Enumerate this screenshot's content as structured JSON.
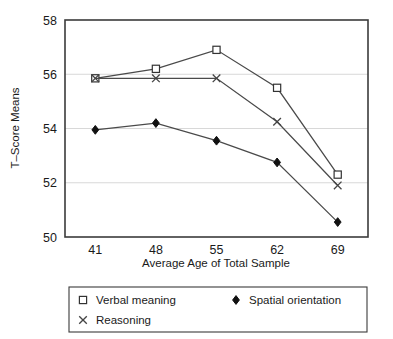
{
  "chart_data": {
    "type": "line",
    "title": "",
    "xlabel": "Average Age of Total Sample",
    "ylabel": "T–Score Means",
    "categories": [
      "41",
      "48",
      "55",
      "62",
      "69"
    ],
    "x": [
      41,
      48,
      55,
      62,
      69
    ],
    "xlim": [
      37.5,
      72.5
    ],
    "ylim": [
      50,
      58
    ],
    "yticks": [
      "50",
      "52",
      "54",
      "56",
      "58"
    ],
    "ytick_values": [
      50,
      52,
      54,
      56,
      58
    ],
    "grid": "horizontal",
    "legend_position": "below-plot",
    "series": [
      {
        "name": "Verbal meaning",
        "marker": "open-square",
        "color": "#333333",
        "values": [
          55.85,
          56.2,
          56.9,
          55.5,
          52.3
        ]
      },
      {
        "name": "Reasoning",
        "marker": "cross-x",
        "color": "#333333",
        "values": [
          55.85,
          55.85,
          55.85,
          54.25,
          51.9
        ]
      },
      {
        "name": "Spatial orientation",
        "marker": "filled-diamond",
        "color": "#111111",
        "values": [
          53.95,
          54.2,
          53.55,
          52.75,
          50.55
        ]
      }
    ]
  },
  "legend": {
    "entries": [
      {
        "label": "Verbal meaning",
        "marker": "open-square"
      },
      {
        "label": "Reasoning",
        "marker": "cross-x"
      },
      {
        "label": "Spatial orientation",
        "marker": "filled-diamond"
      }
    ]
  },
  "colors": {
    "frame": "#3b3b3b",
    "gridline": "#d8d8d8",
    "line": "#4a4a4a",
    "marker_fill_open": "#ffffff",
    "marker_fill_solid": "#111111",
    "text": "#1a1a1a",
    "background": "#ffffff"
  }
}
